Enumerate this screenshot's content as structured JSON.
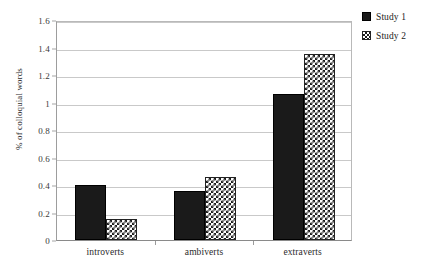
{
  "chart_data": {
    "type": "bar",
    "title": "",
    "xlabel": "",
    "ylabel": "% of colloquial words",
    "categories": [
      "introverts",
      "ambiverts",
      "extraverts"
    ],
    "series": [
      {
        "name": "Study 1",
        "values": [
          0.4,
          0.36,
          1.06
        ],
        "pattern": "solid"
      },
      {
        "name": "Study 2",
        "values": [
          0.15,
          0.46,
          1.35
        ],
        "pattern": "checkered"
      }
    ],
    "ylim": [
      0,
      1.6
    ],
    "ytick_values": [
      0,
      0.2,
      0.4,
      0.6,
      0.8,
      1,
      1.2,
      1.4,
      1.6
    ],
    "ytick_labels": [
      "0",
      "0.2",
      "0.4",
      "0.6",
      "0.8",
      "1",
      "1.2",
      "1.4",
      "1.6"
    ],
    "grid": true,
    "legend_position": "right-top"
  },
  "legend": {
    "items": [
      {
        "label": "Study 1"
      },
      {
        "label": "Study 2"
      }
    ]
  },
  "caption": {
    "text": ""
  },
  "colors": {
    "series1": "#1a1a1a",
    "series2_ink": "#1e1e1e",
    "series2_bg": "#ffffff",
    "gridline": "#c9c9c9",
    "axis": "#8a8a8a",
    "text": "#2b2b2b"
  }
}
